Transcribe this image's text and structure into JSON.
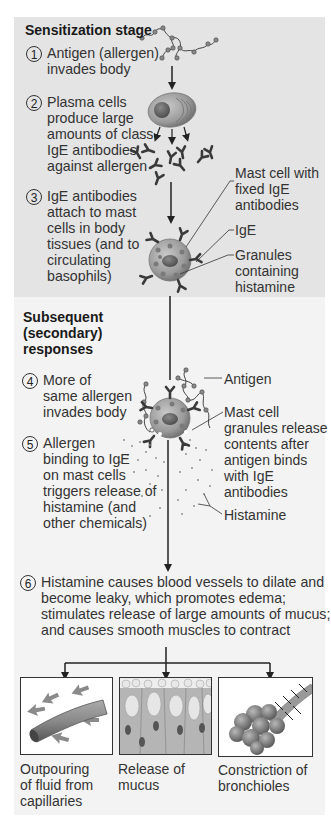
{
  "sections": {
    "sensitization": {
      "title": "Sensitization stage",
      "bg_color": "#e4e4e4",
      "steps": [
        {
          "number": "1",
          "lines": "Antigen (allergen)\ninvades body"
        },
        {
          "number": "2",
          "lines": "Plasma cells\nproduce large\namounts of class\nIgE antibodies\nagainst allergen"
        },
        {
          "number": "3",
          "lines": "IgE antibodies\nattach to mast\ncells in body\ntissues (and to\ncirculating\nbasophils)"
        }
      ],
      "labels": {
        "mast_cell": "Mast cell with\nfixed IgE\nantibodies",
        "ige": "IgE",
        "granules": "Granules\ncontaining\nhistamine"
      }
    },
    "secondary": {
      "title": "Subsequent\n(secondary)\nresponses",
      "bg_color": "#f3f3f3",
      "steps": [
        {
          "number": "4",
          "lines": "More of\nsame allergen\ninvades body"
        },
        {
          "number": "5",
          "lines": "Allergen\nbinding to IgE\non mast cells\ntriggers release of\nhistamine (and\nother chemicals)"
        },
        {
          "number": "6",
          "lines": "Histamine causes blood vessels to dilate and\nbecome leaky, which promotes edema;\nstimulates release of large amounts of mucus;\nand causes smooth muscles to contract"
        }
      ],
      "labels": {
        "antigen": "Antigen",
        "granules_release": "Mast cell\ngranules release\ncontents after\nantigen binds\nwith IgE\nantibodies",
        "histamine": "Histamine"
      }
    }
  },
  "effects": [
    {
      "icon": "capillary-icon",
      "caption": "Outpouring\nof fluid from\ncapillaries"
    },
    {
      "icon": "mucus-cells-icon",
      "caption": "Release of\nmucus"
    },
    {
      "icon": "bronchioles-icon",
      "caption": "Constriction of\nbronchioles"
    }
  ]
}
